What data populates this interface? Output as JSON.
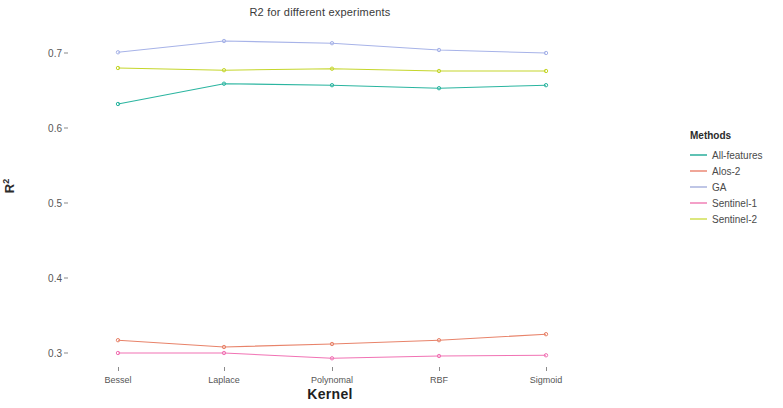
{
  "chart_data": {
    "type": "line",
    "title": "R2 for different experiments",
    "xlabel": "Kernel",
    "ylabel": "R²",
    "categories": [
      "Bessel",
      "Laplace",
      "Polynomal",
      "RBF",
      "Sigmoid"
    ],
    "ylim": [
      0.27,
      0.725
    ],
    "yticks": [
      0.3,
      0.4,
      0.5,
      0.6,
      0.7
    ],
    "ytick_labels": [
      "0.3",
      "0.4",
      "0.5",
      "0.6",
      "0.7"
    ],
    "grid": false,
    "legend_position": "right",
    "legend_title": "Methods",
    "markers": true,
    "series": [
      {
        "name": "All-features",
        "color": "#2BB5A0",
        "values": [
          0.632,
          0.659,
          0.657,
          0.653,
          0.657
        ]
      },
      {
        "name": "Alos-2",
        "color": "#E8836A",
        "values": [
          0.317,
          0.308,
          0.312,
          0.317,
          0.325
        ]
      },
      {
        "name": "GA",
        "color": "#A7B3E8",
        "values": [
          0.701,
          0.716,
          0.713,
          0.704,
          0.7
        ]
      },
      {
        "name": "Sentinel-1",
        "color": "#F173B4",
        "values": [
          0.3,
          0.3,
          0.293,
          0.296,
          0.297
        ]
      },
      {
        "name": "Sentinel-2",
        "color": "#C5D62C",
        "values": [
          0.68,
          0.677,
          0.679,
          0.676,
          0.676
        ]
      }
    ]
  },
  "legend": {
    "title": "Methods",
    "items": [
      {
        "label": "All-features",
        "color": "#5FC2B4"
      },
      {
        "label": "Alos-2",
        "color": "#F0A698"
      },
      {
        "label": "GA",
        "color": "#BFC6E6"
      },
      {
        "label": "Sentinel-1",
        "color": "#F4A0C8"
      },
      {
        "label": "Sentinel-2",
        "color": "#DCE77E"
      }
    ]
  }
}
